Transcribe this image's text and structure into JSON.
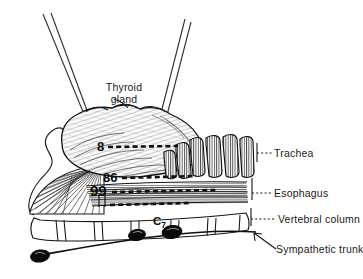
{
  "figure": {
    "background_color": "#ffffff",
    "ink_color": "#141414",
    "width": 361,
    "height": 279
  },
  "labels": {
    "thyroid_line1": "Thyroid",
    "thyroid_line2": "gland",
    "trachea": "Trachea",
    "esophagus": "Esophagus",
    "vertebral_column": "Vertebral  column",
    "sympathetic_trunk": "Sympathetic  trunk"
  },
  "annotations": {
    "num_8": "8",
    "num_86": "86",
    "num_99": "99",
    "vertebra_c7": "C",
    "vertebra_c7_sub": "7"
  },
  "structures": [
    {
      "name": "needle-pair-left",
      "kind": "instrument",
      "count": 2
    },
    {
      "name": "needle-pair-right",
      "kind": "instrument",
      "count": 2
    },
    {
      "name": "thyroid-gland",
      "kind": "organ"
    },
    {
      "name": "trachea-rings",
      "kind": "organ",
      "count": 6
    },
    {
      "name": "esophagus-fibers",
      "kind": "organ"
    },
    {
      "name": "muscle-fan",
      "kind": "muscle"
    },
    {
      "name": "vertebral-column",
      "kind": "bone",
      "count": 6
    },
    {
      "name": "sympathetic-trunk",
      "kind": "nerve"
    },
    {
      "name": "sympathetic-ganglion",
      "kind": "nerve",
      "count": 3
    }
  ]
}
